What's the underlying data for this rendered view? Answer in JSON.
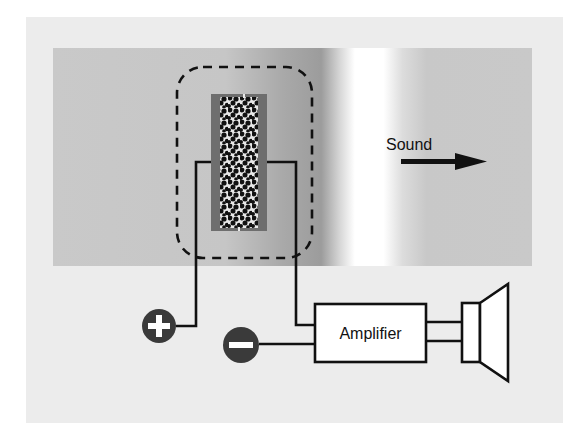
{
  "diagram": {
    "type": "carbon-microphone-circuit",
    "labels": {
      "sound": "Sound",
      "amplifier": "Amplifier",
      "positive_terminal": "+",
      "negative_terminal": "−"
    },
    "components": [
      {
        "id": "sound-wave-band",
        "kind": "gradient-band",
        "description": "gray band with bright compression stripe"
      },
      {
        "id": "carbon-microphone",
        "kind": "granule-capsule"
      },
      {
        "id": "enclosure",
        "kind": "dashed-rounded-box"
      },
      {
        "id": "positive-terminal",
        "kind": "terminal",
        "symbol": "+"
      },
      {
        "id": "negative-terminal",
        "kind": "terminal",
        "symbol": "−"
      },
      {
        "id": "amplifier",
        "kind": "box",
        "label": "Amplifier"
      },
      {
        "id": "loudspeaker",
        "kind": "speaker"
      }
    ],
    "connections": [
      {
        "from": "positive-terminal",
        "to": "carbon-microphone"
      },
      {
        "from": "carbon-microphone",
        "to": "amplifier"
      },
      {
        "from": "negative-terminal",
        "to": "amplifier"
      },
      {
        "from": "amplifier",
        "to": "loudspeaker"
      }
    ],
    "arrow": {
      "label": "Sound",
      "direction": "right"
    }
  },
  "colors": {
    "outer_panel": "#ececec",
    "band_gray": "#c9c9c9",
    "band_dark": "#9a9a9a",
    "band_highlight": "#ffffff",
    "mic_frame": "#6e6e6e",
    "granules": "#111111",
    "terminal_fill": "#3a3a3a",
    "line": "#111111"
  }
}
